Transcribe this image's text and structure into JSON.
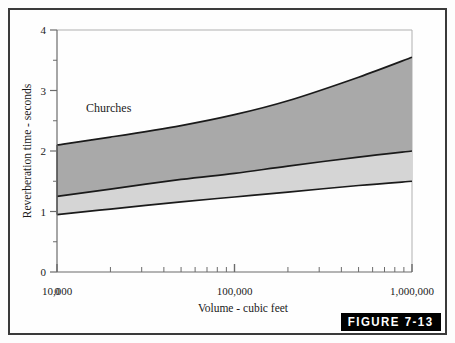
{
  "figure": {
    "badge_label": "FIGURE 7-13",
    "series_label": "Churches"
  },
  "colors": {
    "upper_band": "#a9a9a9",
    "lower_band": "#d5d5d5",
    "curve_line": "#1a1a1a",
    "axis": "#6b6b6b",
    "frame_border": "#3a3a3a",
    "badge_background": "#000000",
    "badge_text": "#ffffff",
    "page_background": "#fefefe"
  },
  "axes": {
    "x": {
      "label": "Volume - cubic feet",
      "scale": "log",
      "origin_label": "0",
      "tick_labels": [
        "10,000",
        "100,000",
        "1,000,000"
      ],
      "tick_values": [
        10000,
        100000,
        1000000
      ],
      "range": [
        10000,
        1000000
      ]
    },
    "y": {
      "label": "Reverberation time - seconds",
      "scale": "linear",
      "tick_labels": [
        "0",
        "1",
        "2",
        "3",
        "4"
      ],
      "tick_values": [
        0,
        1,
        2,
        3,
        4
      ],
      "minor_tick_values": [
        0.5,
        1.5,
        2.5,
        3.5
      ],
      "range": [
        0,
        4
      ]
    }
  },
  "chart_data": {
    "type": "area",
    "title": "",
    "subtitle": "",
    "xlabel": "Volume - cubic feet",
    "ylabel": "Reverberation time - seconds",
    "xscale": "log",
    "xlim": [
      10000,
      1000000
    ],
    "ylim": [
      0,
      4
    ],
    "grid": false,
    "legend_position": "inside-upper-left",
    "annotations": [
      "Churches"
    ],
    "x": [
      10000,
      20000,
      50000,
      100000,
      200000,
      500000,
      1000000
    ],
    "series": [
      {
        "name": "Upper limit",
        "values": [
          2.1,
          2.23,
          2.42,
          2.6,
          2.83,
          3.22,
          3.55
        ]
      },
      {
        "name": "Optimum",
        "values": [
          1.25,
          1.37,
          1.53,
          1.63,
          1.75,
          1.9,
          2.0
        ]
      },
      {
        "name": "Lower limit",
        "values": [
          0.95,
          1.04,
          1.16,
          1.24,
          1.32,
          1.43,
          1.5
        ]
      }
    ],
    "bands": [
      {
        "name": "Upper range band",
        "fill": "#a9a9a9",
        "upper_series": "Upper limit",
        "lower_series": "Optimum"
      },
      {
        "name": "Lower range band",
        "fill": "#d5d5d5",
        "upper_series": "Optimum",
        "lower_series": "Lower limit"
      }
    ]
  }
}
